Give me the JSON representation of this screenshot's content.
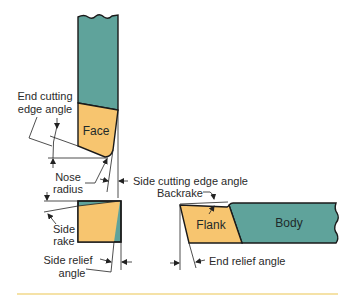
{
  "diagram": {
    "colors": {
      "shank": "#5fa39b",
      "tip": "#f7c56f",
      "outline": "#1a1a1a",
      "rule": "#f2d98a"
    },
    "parts": {
      "face": "Face",
      "flank": "Flank",
      "body": "Body"
    },
    "labels": {
      "end_cutting_edge_angle_line1": "End cutting",
      "end_cutting_edge_angle_line2": "edge angle",
      "nose_radius_line1": "Nose",
      "nose_radius_line2": "radius",
      "side_cutting_edge_angle": "Side cutting edge angle",
      "backrake": "Backrake",
      "side_rake_line1": "Side",
      "side_rake_line2": "rake",
      "side_relief_angle_line1": "Side relief",
      "side_relief_angle_line2": "angle",
      "end_relief_angle": "End relief angle"
    },
    "views": [
      "top-view",
      "end-view",
      "side-view"
    ]
  }
}
